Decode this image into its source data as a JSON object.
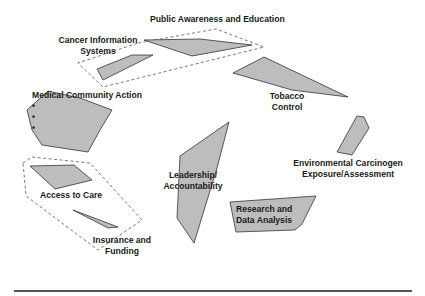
{
  "diagram": {
    "labels": {
      "public_awareness": "Public Awareness and Education",
      "cancer_info_1": "Cancer Information",
      "cancer_info_2": "Systems",
      "medical_title": "Medical Community Action",
      "medical_items": [
        "Education",
        "Collaboration",
        "Quality/Best",
        "Practices"
      ],
      "tobacco_1": "Tobacco",
      "tobacco_2": "Control",
      "environmental_1": "Environmental Carcinogen",
      "environmental_2": "Exposure/Assessment",
      "leadership_1": "Leadership/",
      "leadership_2": "Accountability",
      "research_1": "Research and",
      "research_2": "Data Analysis",
      "access": "Access to Care",
      "insurance_1": "Insurance and",
      "insurance_2": "Funding"
    },
    "bullet": "•",
    "colors": {
      "shape_fill": "#bdbdbd",
      "shape_stroke": "#333333",
      "dash": "#555555"
    }
  }
}
